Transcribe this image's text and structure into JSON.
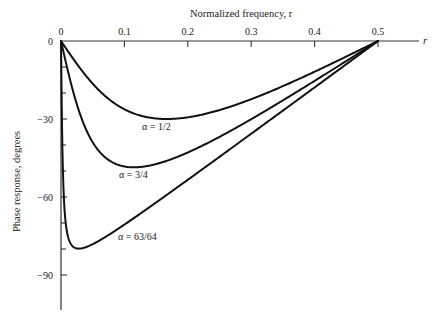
{
  "chart_data": {
    "type": "line",
    "title": "",
    "xlabel": "Normalized frequency, r",
    "ylabel": "Phase response, degrees",
    "x_axis_end_label": "r",
    "xlim": [
      0,
      0.5
    ],
    "ylim": [
      -90,
      0
    ],
    "x_ticks": [
      0,
      0.1,
      0.2,
      0.3,
      0.4,
      0.5
    ],
    "x_tick_labels": [
      "0",
      "0.1",
      "0.2",
      "0.3",
      "0.4",
      "0.5"
    ],
    "y_ticks": [
      0,
      -30,
      -60,
      -90
    ],
    "y_tick_labels": [
      "0",
      "−30",
      "−60",
      "−90"
    ],
    "y_minor_tick_step": 10,
    "x_axis_position": "top",
    "grid": false,
    "legend": "inline curve labels",
    "x": [
      0,
      0.0125,
      0.025,
      0.05,
      0.075,
      0.1,
      0.125,
      0.15,
      0.175,
      0.2,
      0.25,
      0.3,
      0.35,
      0.4,
      0.45,
      0.5
    ],
    "series": [
      {
        "name": "α = 1/2",
        "alpha": 0.5,
        "values": [
          0,
          -4.6,
          -8.9,
          -16.3,
          -21.9,
          -25.9,
          -28.7,
          -29.9,
          -29.9,
          -29.0,
          -26.6,
          -22.8,
          -17.8,
          -12.0,
          -6.1,
          0
        ],
        "label_pos": [
          0.13,
          -33
        ],
        "peak": {
          "r": 0.167,
          "deg": -30
        }
      },
      {
        "name": "α = 3/4",
        "alpha": 0.75,
        "values": [
          0,
          -13.3,
          -23.6,
          -36.8,
          -43.9,
          -47.4,
          -48.6,
          -48.2,
          -46.6,
          -44.1,
          -36.9,
          -28.7,
          -20.7,
          -13.3,
          -6.4,
          0
        ],
        "label_pos": [
          0.09,
          -51
        ],
        "peak": {
          "r": 0.115,
          "deg": -48.6
        }
      },
      {
        "name": "α = 63/64",
        "alpha": 0.984375,
        "values": [
          0,
          -70.4,
          -79.5,
          -78.7,
          -74.4,
          -70.0,
          -65.7,
          -61.2,
          -56.8,
          -52.4,
          -43.4,
          -34.5,
          -25.6,
          -17.0,
          -8.5,
          0
        ],
        "label_pos": [
          0.09,
          -75
        ],
        "peak": {
          "r": 0.028,
          "deg": -79.8
        }
      }
    ]
  },
  "labels": {
    "xlabel": "Normalized frequency, r",
    "ylabel": "Phase response, degrees",
    "x_end": "r",
    "series1": "α = 1/2",
    "series2": "α = 3/4",
    "series3": "α = 63/64"
  }
}
